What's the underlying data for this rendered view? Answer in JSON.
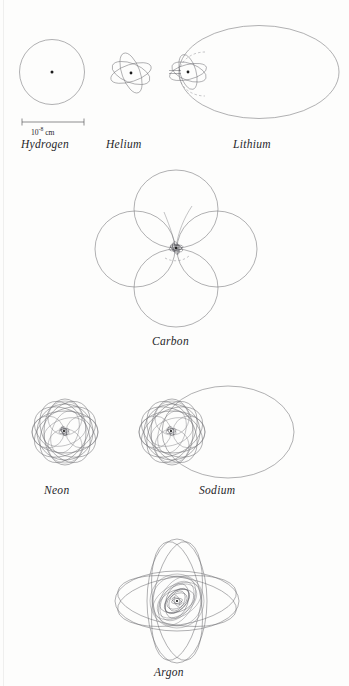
{
  "figure": {
    "type": "diagram",
    "background_color": "#fdfdfc",
    "line_color": "#6f6f74",
    "nucleus_color": "#1b1b1b",
    "label_color": "#26262a"
  },
  "scale": {
    "mantissa": "10",
    "exponent": "-8",
    "unit": "cm",
    "full_text": "10-8 cm",
    "bar_left_px": 22,
    "bar_right_px": 84,
    "bar_y_px": 122
  },
  "atoms": [
    {
      "name": "Hydrogen",
      "electrons": 1,
      "orbit_count": 1,
      "shape": "single circle",
      "label": "Hydrogen",
      "center": {
        "x": 52,
        "y": 72
      },
      "radius_px": 32,
      "has_nucleus_dot": true
    },
    {
      "name": "Helium",
      "electrons": 2,
      "orbit_count": 2,
      "shape": "two crossed ellipses",
      "label": "Helium",
      "center": {
        "x": 131,
        "y": 73
      },
      "radius_px": 22,
      "has_nucleus_dot": true
    },
    {
      "name": "Lithium",
      "electrons": 3,
      "orbit_count": 3,
      "shape": "helium core plus one large outer ellipse and dashed arc",
      "label": "Lithium",
      "center": {
        "x": 259,
        "y": 72
      },
      "outer_rx_px": 80,
      "outer_ry_px": 47,
      "core_center": {
        "x": 188,
        "y": 72
      },
      "has_nucleus_dot": true,
      "has_dashed_orbit": true
    },
    {
      "name": "Carbon",
      "electrons": 6,
      "orbit_count": 6,
      "shape": "four-petal rosette of large ellipses with dense core",
      "label": "Carbon",
      "center": {
        "x": 176,
        "y": 248
      },
      "petal_rx_px": 42,
      "petal_ry_px": 52,
      "petal_count": 4,
      "has_dashed_orbit": true
    },
    {
      "name": "Neon",
      "electrons": 10,
      "orbit_count": 10,
      "shape": "dense rosette of many overlapping ellipses",
      "label": "Neon",
      "center": {
        "x": 65,
        "y": 432
      },
      "rosette_rx_px": 40,
      "rosette_ry_px": 33,
      "petal_count": 8
    },
    {
      "name": "Sodium",
      "electrons": 11,
      "orbit_count": 11,
      "shape": "neon core plus one large outer ellipse to the right",
      "label": "Sodium",
      "center": {
        "x": 172,
        "y": 432
      },
      "core_center": {
        "x": 172,
        "y": 432
      },
      "outer_center": {
        "x": 228,
        "y": 432
      },
      "outer_rx_px": 66,
      "outer_ry_px": 46
    },
    {
      "name": "Argon",
      "electrons": 18,
      "orbit_count": 18,
      "shape": "cross rosette of elongated ellipses with dense inner core",
      "label": "Argon",
      "center": {
        "x": 177,
        "y": 601
      },
      "lobe_rx_px": 30,
      "lobe_ry_px": 63,
      "lobe_count": 4,
      "core_radius_px": 25
    }
  ],
  "labels": {
    "hydrogen": "Hydrogen",
    "helium": "Helium",
    "lithium": "Lithium",
    "carbon": "Carbon",
    "neon": "Neon",
    "sodium": "Sodium",
    "argon": "Argon"
  }
}
